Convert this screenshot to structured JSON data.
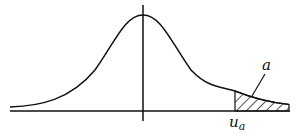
{
  "diagram": {
    "type": "normal-distribution-upper-tail",
    "alpha_label": "a",
    "critical_value_label": "u",
    "critical_value_subscript": "a",
    "colors": {
      "stroke": "#111111",
      "background": "#ffffff"
    }
  }
}
